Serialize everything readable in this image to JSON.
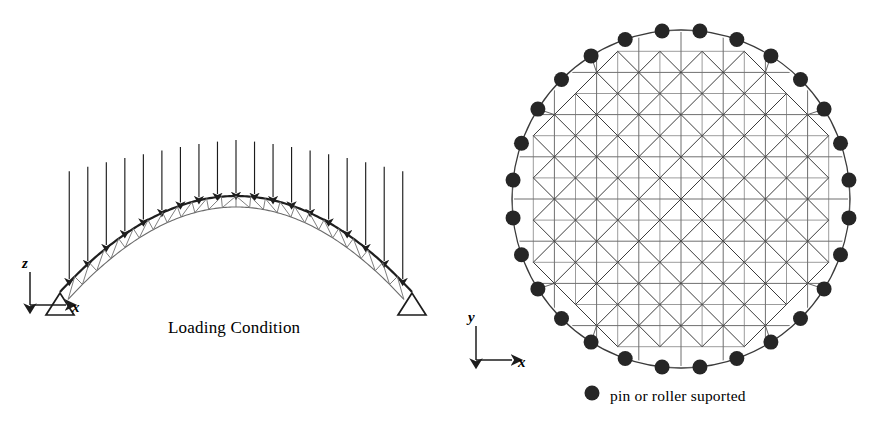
{
  "figure": {
    "type": "structural-engineering-diagram",
    "views": [
      {
        "id": "elevation",
        "caption": "Loading Condition",
        "description": "Side elevation of double-layer arch truss under uniform downward nodal loads",
        "axes": {
          "vertical": "z",
          "horizontal": "x"
        },
        "supports": {
          "symbol": "open-triangle",
          "count": 2
        },
        "load": {
          "direction": "downward",
          "arrow_count": 19
        }
      },
      {
        "id": "plan",
        "description": "Plan view of circular double-layer space truss dome",
        "axes": {
          "vertical": "y",
          "horizontal": "x"
        },
        "boundary_nodes": 28
      }
    ],
    "legend": {
      "marker": "filled-circle",
      "label": "pin or roller suported"
    },
    "colors": {
      "line": "#2b2b2b",
      "thin_line": "#595959",
      "node_fill": "#262626",
      "background": "#ffffff"
    }
  },
  "chart_data": {
    "type": "diagram",
    "title": "Loading Condition",
    "elevation": {
      "arch": {
        "span_x": [
          60,
          412
        ],
        "springing_y": 292,
        "crown_y": 196,
        "top_chord_rise": 96,
        "truss_depth": 11,
        "panels": 24
      },
      "load_arrows": {
        "count": 19,
        "tail_y_min": 140,
        "note": "tails aligned near horizontal band, tips follow arch profile"
      },
      "axis_origin": [
        30,
        305
      ],
      "labels": {
        "z": "z",
        "x": "x"
      }
    },
    "plan": {
      "circle_center": [
        681,
        199
      ],
      "circle_radius": 169,
      "grid_cells": 8,
      "grid_pitch": 42.2,
      "boundary_node_count": 28,
      "node_radius": 7.5,
      "axis_origin": [
        476,
        360
      ],
      "labels": {
        "y": "y",
        "x": "x"
      }
    }
  }
}
